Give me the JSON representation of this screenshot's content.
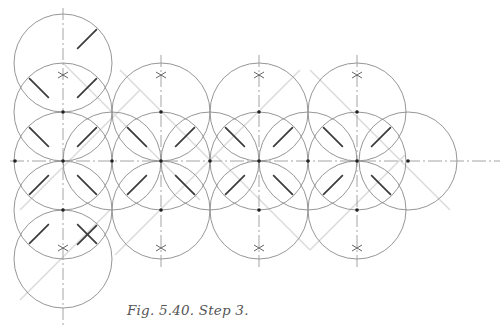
{
  "figure": {
    "caption": "Fig. 5.40. Step 3.",
    "colors": {
      "circle": "#8a8a8a",
      "axis": "#9a9a9a",
      "guide": "#dcdcdc",
      "bold": "#3a3a3a",
      "dot": "#222222",
      "star": "#555555"
    },
    "radius": 49,
    "axes": {
      "horizontal": [
        {
          "y": 161,
          "x1": 10,
          "x2": 500
        }
      ],
      "vertical": [
        {
          "x": 63,
          "y1": 8,
          "y2": 325
        },
        {
          "x": 161,
          "y1": 55,
          "y2": 270
        },
        {
          "x": 259,
          "y1": 55,
          "y2": 270
        },
        {
          "x": 357,
          "y1": 55,
          "y2": 270
        }
      ]
    },
    "circles": [
      {
        "cx": 63,
        "cy": 63
      },
      {
        "cx": 63,
        "cy": 112
      },
      {
        "cx": 63,
        "cy": 161
      },
      {
        "cx": 63,
        "cy": 210
      },
      {
        "cx": 63,
        "cy": 259
      },
      {
        "cx": 112,
        "cy": 161
      },
      {
        "cx": 161,
        "cy": 112
      },
      {
        "cx": 161,
        "cy": 161
      },
      {
        "cx": 161,
        "cy": 210
      },
      {
        "cx": 210,
        "cy": 161
      },
      {
        "cx": 259,
        "cy": 112
      },
      {
        "cx": 259,
        "cy": 161
      },
      {
        "cx": 259,
        "cy": 210
      },
      {
        "cx": 308,
        "cy": 161
      },
      {
        "cx": 357,
        "cy": 112
      },
      {
        "cx": 357,
        "cy": 161
      },
      {
        "cx": 357,
        "cy": 210
      },
      {
        "cx": 408,
        "cy": 161
      }
    ],
    "dots": [
      {
        "x": 63,
        "y": 112
      },
      {
        "x": 63,
        "y": 161
      },
      {
        "x": 63,
        "y": 210
      },
      {
        "x": 15,
        "y": 161
      },
      {
        "x": 112,
        "y": 161
      },
      {
        "x": 161,
        "y": 112
      },
      {
        "x": 161,
        "y": 161
      },
      {
        "x": 161,
        "y": 210
      },
      {
        "x": 210,
        "y": 161
      },
      {
        "x": 259,
        "y": 112
      },
      {
        "x": 259,
        "y": 161
      },
      {
        "x": 259,
        "y": 210
      },
      {
        "x": 308,
        "y": 161
      },
      {
        "x": 357,
        "y": 112
      },
      {
        "x": 357,
        "y": 161
      },
      {
        "x": 357,
        "y": 210
      },
      {
        "x": 408,
        "y": 161
      }
    ],
    "stars": [
      {
        "x": 63,
        "y": 75
      },
      {
        "x": 63,
        "y": 248
      },
      {
        "x": 161,
        "y": 75
      },
      {
        "x": 161,
        "y": 248
      },
      {
        "x": 259,
        "y": 75
      },
      {
        "x": 259,
        "y": 248
      },
      {
        "x": 357,
        "y": 75
      },
      {
        "x": 357,
        "y": 248
      }
    ],
    "bold_segments": [
      {
        "cx": 63,
        "cy": 63,
        "dirs": [
          "ne"
        ]
      },
      {
        "cx": 63,
        "cy": 112,
        "dirs": [
          "nw",
          "ne"
        ]
      },
      {
        "cx": 63,
        "cy": 161,
        "dirs": [
          "nw",
          "ne",
          "sw",
          "se"
        ]
      },
      {
        "cx": 63,
        "cy": 210,
        "dirs": [
          "sw",
          "se"
        ]
      },
      {
        "cx": 63,
        "cy": 259,
        "dirs": [
          "ne"
        ]
      },
      {
        "cx": 161,
        "cy": 161,
        "dirs": [
          "nw",
          "ne",
          "sw",
          "se"
        ]
      },
      {
        "cx": 259,
        "cy": 161,
        "dirs": [
          "nw",
          "ne",
          "sw",
          "se"
        ]
      },
      {
        "cx": 357,
        "cy": 161,
        "dirs": [
          "nw",
          "ne",
          "sw",
          "se"
        ]
      }
    ],
    "guides": [
      {
        "x1": 63,
        "y1": 63,
        "x2": 200,
        "y2": 200
      },
      {
        "x1": 20,
        "y1": 210,
        "x2": 140,
        "y2": 90
      },
      {
        "x1": 120,
        "y1": 70,
        "x2": 210,
        "y2": 160
      },
      {
        "x1": 210,
        "y1": 160,
        "x2": 300,
        "y2": 70
      },
      {
        "x1": 310,
        "y1": 70,
        "x2": 450,
        "y2": 210
      },
      {
        "x1": 115,
        "y1": 255,
        "x2": 215,
        "y2": 155
      },
      {
        "x1": 215,
        "y1": 155,
        "x2": 310,
        "y2": 250
      },
      {
        "x1": 310,
        "y1": 250,
        "x2": 405,
        "y2": 155
      },
      {
        "x1": 20,
        "y1": 300,
        "x2": 110,
        "y2": 210
      }
    ]
  }
}
